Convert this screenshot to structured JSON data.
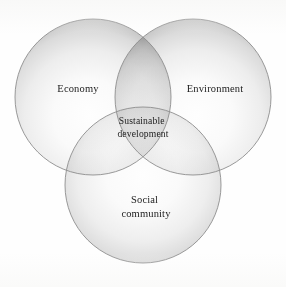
{
  "figure": {
    "type": "venn-diagram",
    "set_count": 3,
    "background_color": "#fefefe",
    "outline_color": "#8d8d8d",
    "text_color": "#1c1c1c",
    "circles": [
      {
        "id": "economy",
        "label": "Economy",
        "label_lines": [
          "Economy"
        ],
        "cx": 93,
        "cy": 97,
        "r": 78,
        "label_x": 78,
        "label_y": 92,
        "fill_light": "#fdfdfd",
        "fill_dark": "#c9c9c9"
      },
      {
        "id": "environment",
        "label": "Environment",
        "label_lines": [
          "Environment"
        ],
        "cx": 193,
        "cy": 97,
        "r": 78,
        "label_x": 215,
        "label_y": 92,
        "fill_light": "#fdfdfd",
        "fill_dark": "#c9c9c9"
      },
      {
        "id": "social-community",
        "label": "Social community",
        "label_lines": [
          "Social",
          "community"
        ],
        "cx": 143,
        "cy": 185,
        "r": 78,
        "label_x": 146,
        "label_y": 203,
        "fill_light": "#fdfdfd",
        "fill_dark": "#c9c9c9"
      }
    ],
    "center_region": {
      "id": "sustainable-development",
      "label": "Sustainable development",
      "label_lines": [
        "Sustainable",
        "development"
      ],
      "label_x": 143,
      "label_y": 124
    }
  }
}
